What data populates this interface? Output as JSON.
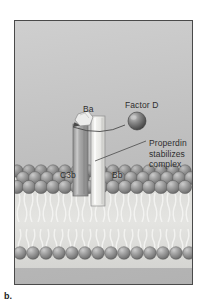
{
  "figure": {
    "letter": "b.",
    "caption": "C3bBb (C3 convertase)",
    "panel_bg_top": "#cfcfcf",
    "panel_bg_bottom": "#b2b2b2",
    "panel_border_color": "#4a4a4a",
    "text_color": "#2e2e2e"
  },
  "labels": {
    "ba": "Ba",
    "factor_d": "Factor D",
    "c3b": "C3b",
    "bb": "Bb",
    "properdin_line1": "Properdin",
    "properdin_line2": "stabilizes",
    "properdin_line3": "complex"
  },
  "structures": {
    "factor_d_sphere": {
      "name": "factor-d-sphere",
      "fill_light": "#b9b9b9",
      "fill_dark": "#4f4f4f",
      "cx": 122,
      "cy": 100,
      "r": 9
    },
    "ba_fragment": {
      "name": "ba-fragment",
      "fill": "#e8e8e6",
      "stroke": "#8a8a8a"
    },
    "c3b_column": {
      "name": "c3b-protein-column",
      "fill": "#9a9a9a",
      "highlight": "#c2c2c2",
      "stroke": "#6d6d6d"
    },
    "bb_column": {
      "name": "bb-protein-column",
      "fill": "#ededea",
      "stroke": "#8f8f8f"
    },
    "membrane": {
      "head_fill_light": "#b4b4b4",
      "head_fill_dark": "#6f6f6f",
      "head_stroke": "#5c5c5c",
      "tail_color": "#eeeeec",
      "interior_fill": "#d8d8d6",
      "upper_leaflet_rows": 2,
      "lower_leaflet_rows": 1
    },
    "leader_line": {
      "name": "properdin-leader-line",
      "color": "#4a4a4a"
    },
    "curved_arrow": {
      "name": "ba-release-arrow",
      "color": "#4a4a4a"
    }
  }
}
